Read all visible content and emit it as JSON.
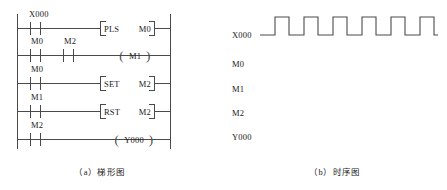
{
  "figure": {
    "left_caption": "（a）梯形图",
    "right_caption": "（b）时序图"
  },
  "ladder": {
    "rungs": [
      {
        "contacts": [
          {
            "name": "X000",
            "type": "no-contact"
          }
        ],
        "output": {
          "kind": "instruction",
          "instruction": "PLS",
          "operand": "M0"
        }
      },
      {
        "contacts": [
          {
            "name": "M0",
            "type": "no-contact"
          },
          {
            "name": "M2",
            "type": "no-contact"
          }
        ],
        "output": {
          "kind": "coil",
          "operand": "M1"
        }
      },
      {
        "contacts": [
          {
            "name": "M0",
            "type": "no-contact"
          }
        ],
        "output": {
          "kind": "instruction",
          "instruction": "SET",
          "operand": "M2"
        }
      },
      {
        "contacts": [
          {
            "name": "M1",
            "type": "no-contact"
          }
        ],
        "output": {
          "kind": "instruction",
          "instruction": "RST",
          "operand": "M2"
        }
      },
      {
        "contacts": [
          {
            "name": "M2",
            "type": "no-contact"
          }
        ],
        "output": {
          "kind": "coil",
          "operand": "Y000"
        }
      }
    ]
  },
  "timing": {
    "signals": [
      {
        "label": "X000",
        "has_waveform": true
      },
      {
        "label": "M0",
        "has_waveform": false
      },
      {
        "label": "M1",
        "has_waveform": false
      },
      {
        "label": "M2",
        "has_waveform": false
      },
      {
        "label": "Y000",
        "has_waveform": false
      }
    ],
    "x000_waveform": {
      "pulse_count": 6,
      "levels": [
        0,
        1,
        0,
        1,
        0,
        1,
        0,
        1,
        0,
        1,
        0,
        1,
        0
      ],
      "description": "six rectangular pulses, low before first and after last"
    }
  },
  "colors": {
    "line": "#4a4a4a",
    "text": "#1a1a1a",
    "background": "#ffffff"
  }
}
